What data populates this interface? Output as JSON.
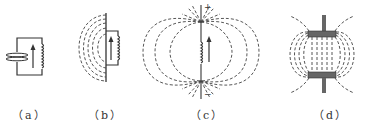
{
  "figure": {
    "panels": [
      {
        "id": "a",
        "label": "（a）",
        "description": "Closed LC circuit: parallel-plate capacitor with inductor coil, current arrow upward"
      },
      {
        "id": "b",
        "label": "（b）",
        "description": "Capacitor plates opened, field lines bulging outward to the left"
      },
      {
        "id": "c",
        "label": "（c）",
        "description": "Straight-line dipole antenna with coil; + at top, − at bottom; field lines loop between ends"
      },
      {
        "id": "d",
        "label": "（d）",
        "description": "Two plates with field lines between them, fringing at edges"
      }
    ],
    "symbols": {
      "plus": "+",
      "minus": "−"
    },
    "colors": {
      "line": "#333333",
      "plate": "#666666",
      "background": "#ffffff"
    }
  }
}
